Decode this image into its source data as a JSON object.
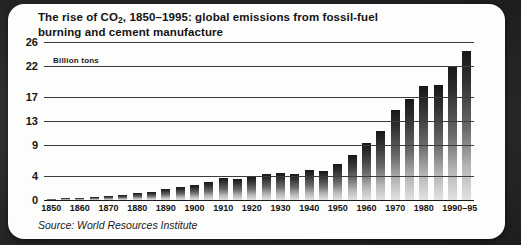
{
  "card": {
    "title_line1": "The rise of CO₂, 1850–1995: global emissions from fossil-fuel",
    "title_line2": "burning and cement manufacture",
    "units_label": "Billion tons",
    "source": "Source: World Resources Institute"
  },
  "chart_data": {
    "type": "bar",
    "title": "The rise of CO2, 1850–1995: global emissions from fossil-fuel burning and cement manufacture",
    "subtitle": "",
    "xlabel": "",
    "ylabel": "Billion tons",
    "ylim": [
      0,
      26
    ],
    "grid": true,
    "legend": "none",
    "ytick_labels": [
      "0",
      "4",
      "9",
      "13",
      "17",
      "22",
      "26"
    ],
    "ytick_values": [
      0,
      4,
      9,
      13,
      17,
      22,
      26
    ],
    "xtick_labels": [
      "1850",
      "1860",
      "1870",
      "1880",
      "1890",
      "1900",
      "1910",
      "1920",
      "1930",
      "1940",
      "1950",
      "1960",
      "1970",
      "1980",
      "1990–95"
    ],
    "xtick_values": [
      1850,
      1860,
      1870,
      1880,
      1890,
      1900,
      1910,
      1920,
      1930,
      1940,
      1950,
      1960,
      1970,
      1980,
      1992.5
    ],
    "categories": [
      "1850",
      "1855",
      "1860",
      "1865",
      "1870",
      "1875",
      "1880",
      "1885",
      "1890",
      "1895",
      "1900",
      "1905",
      "1910",
      "1915",
      "1920",
      "1925",
      "1930",
      "1935",
      "1940",
      "1945",
      "1950",
      "1955",
      "1960",
      "1965",
      "1970",
      "1975",
      "1980",
      "1985",
      "1990",
      "1995"
    ],
    "values": [
      0.2,
      0.3,
      0.4,
      0.5,
      0.7,
      0.9,
      1.2,
      1.4,
      1.8,
      2.1,
      2.4,
      3.0,
      3.6,
      3.5,
      3.8,
      4.3,
      4.4,
      4.2,
      5.0,
      4.7,
      6.0,
      7.4,
      9.4,
      11.4,
      14.8,
      16.6,
      18.7,
      19.0,
      22.0,
      24.5
    ],
    "annotation": "Bars shaded dark at top fading to light at base."
  }
}
